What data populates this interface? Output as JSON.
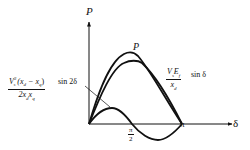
{
  "diagram": {
    "title": "",
    "axes": {
      "y_label": "P",
      "x_label": "δ",
      "x_ticks": [
        {
          "numerator": "π",
          "denominator": "2",
          "position": "pi/2"
        },
        {
          "label": "π",
          "position": "pi"
        }
      ]
    },
    "curves": [
      {
        "name": "resultant-power",
        "label": "P",
        "description": "sum of fundamental and reluctance components"
      },
      {
        "name": "fundamental-power",
        "numerator": "VsEf",
        "denominator": "xd",
        "trailing": "sin δ"
      },
      {
        "name": "reluctance-power",
        "numerator": "Vs² (xd − xq)",
        "denominator": "2xdxq",
        "trailing": "sin 2δ"
      }
    ],
    "labels": {
      "y_axis": "P",
      "x_axis": "δ",
      "peak_label": "P",
      "pi_half_num": "π",
      "pi_half_den": "2",
      "pi": "π",
      "fund_num_V": "V",
      "fund_num_s": "s",
      "fund_num_E": "E",
      "fund_num_f": "f",
      "fund_den_x": "x",
      "fund_den_d": "d",
      "fund_trail": "sin δ",
      "rel_num_V": "V",
      "rel_num_sup": "2",
      "rel_num_sub": "s",
      "rel_num_paren": "(x",
      "rel_num_d": "d",
      "rel_num_minus": " − x",
      "rel_num_q": "q",
      "rel_num_close": ")",
      "rel_den_2x": "2x",
      "rel_den_d": "d",
      "rel_den_x": "x",
      "rel_den_q": "q",
      "rel_trail": "sin 2δ"
    }
  }
}
